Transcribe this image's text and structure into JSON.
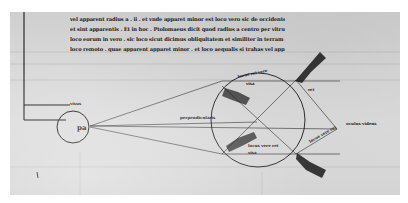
{
  "document": {
    "type": "medieval manuscript page with optical diagram",
    "background_color": "#d8d8d8",
    "ink_color": "#1a1a1a"
  },
  "text_block": {
    "lines": [
      "vel apparent radius a . ii . et vnde apparet minor est loco vero sic de occidente lineas",
      "et sint apparentis . Et in hoc . Ptolomaeus dicit quod radius a centro per vitrum que ab",
      "loco eorum in vero . sic loco sicut dicimus obliquitatem et similiter in terram . Et sic quod",
      "loco remoto . quae apparent apparet minor . et loco aequalis si trahas vel apparet"
    ]
  },
  "diagram": {
    "eye_label": "pa",
    "margin_label": "visus",
    "labels": {
      "upper_left_arc": "locus rei vere",
      "upper_left_arc_sub": "visa",
      "left_vertical": "super aquam",
      "left_wedge": "superficies aque ab eo loco visus",
      "center_left": "perpendicularis",
      "center_lower": "superficies aque loco visus",
      "lower_small": "locus vere rei",
      "lower_small_sub": "visa",
      "upper_right_wedge": "perpendicularis super superficiem aque",
      "upper_right_small": "rei",
      "right_apex": "oculus videns",
      "right_lower_small": "locus vere rei",
      "lower_right_wedge": "perpendicularis super superficiem aque"
    }
  }
}
